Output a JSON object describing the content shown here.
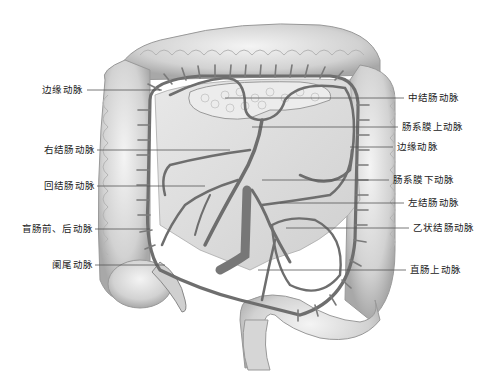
{
  "diagram": {
    "type": "anatomical-illustration",
    "colors": {
      "background": "#ffffff",
      "colon": "#d9d9d9",
      "colon_shadow": "#9a9a9a",
      "artery": "#6e6e6e",
      "leader_line": "#555555",
      "label_text": "#222222"
    },
    "labels_left": [
      {
        "id": "marginal-artery-left",
        "text": "边缘动脉",
        "x": 83,
        "y": 90
      },
      {
        "id": "right-colic-artery",
        "text": "右结肠动脉",
        "x": 95,
        "y": 150
      },
      {
        "id": "ileocolic-artery",
        "text": "回结肠动脉",
        "x": 95,
        "y": 186
      },
      {
        "id": "anterior-posterior-cecal-arteries",
        "text": "盲肠前、后动脉",
        "x": 93,
        "y": 229
      },
      {
        "id": "appendicular-artery",
        "text": "阑尾动脉",
        "x": 93,
        "y": 265
      }
    ],
    "labels_right": [
      {
        "id": "middle-colic-artery",
        "text": "中结肠动脉",
        "x": 408,
        "y": 98
      },
      {
        "id": "superior-mesenteric-artery",
        "text": "肠系膜上动脉",
        "x": 402,
        "y": 127
      },
      {
        "id": "marginal-artery-right",
        "text": "边缘动脉",
        "x": 397,
        "y": 147
      },
      {
        "id": "inferior-mesenteric-artery",
        "text": "肠系膜下动脉",
        "x": 393,
        "y": 180
      },
      {
        "id": "left-colic-artery",
        "text": "左结肠动脉",
        "x": 408,
        "y": 203
      },
      {
        "id": "sigmoid-arteries",
        "text": "乙状结肠动脉",
        "x": 413,
        "y": 228
      },
      {
        "id": "superior-rectal-artery",
        "text": "直肠上动脉",
        "x": 410,
        "y": 270
      }
    ]
  }
}
